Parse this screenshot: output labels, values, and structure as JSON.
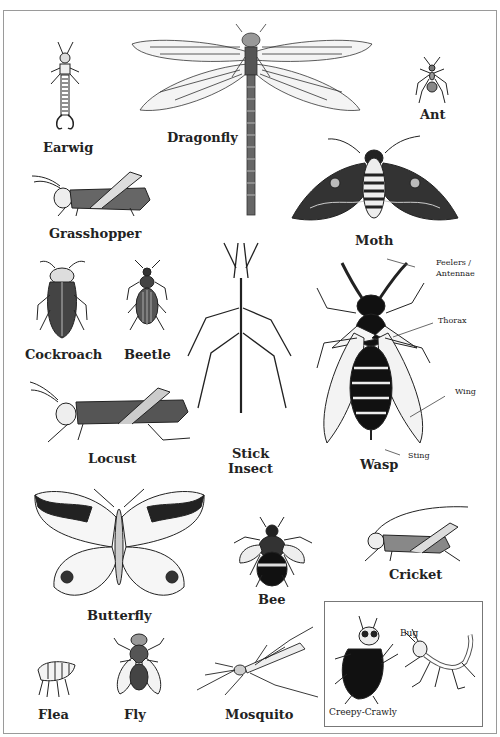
{
  "insects": [
    {
      "name": "Earwig"
    },
    {
      "name": "Dragonfly"
    },
    {
      "name": "Ant"
    },
    {
      "name": "Grasshopper"
    },
    {
      "name": "Moth"
    },
    {
      "name": "Cockroach"
    },
    {
      "name": "Beetle"
    },
    {
      "name": "Stick Insect",
      "line1": "Stick",
      "line2": "Insect"
    },
    {
      "name": "Wasp"
    },
    {
      "name": "Locust"
    },
    {
      "name": "Butterfly"
    },
    {
      "name": "Bee"
    },
    {
      "name": "Cricket"
    },
    {
      "name": "Flea"
    },
    {
      "name": "Fly"
    },
    {
      "name": "Mosquito"
    }
  ],
  "wasp_parts": {
    "feelers_line1": "Feelers /",
    "feelers_line2": "Antennae",
    "thorax": "Thorax",
    "wing": "Wing",
    "sting": "Sting"
  },
  "inset": {
    "bug": "Bug",
    "creepy": "Creepy-Crawly"
  }
}
